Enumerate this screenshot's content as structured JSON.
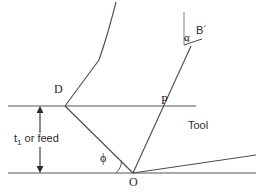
{
  "figure": {
    "stroke_color": "#4a4a4a",
    "line_color": "#8c8c8c",
    "text_color": "#2b2b2b",
    "background": "#ffffff",
    "width": 264,
    "height": 196
  },
  "labels": {
    "point_d": "D",
    "point_p": "P",
    "point_o": "O",
    "point_b_prime": "B´",
    "rake_angle": "α",
    "shear_angle": "ϕ",
    "tool": "Tool",
    "feed_t": "t",
    "feed_sub": "1",
    "feed_rest": " or feed"
  },
  "geometry": {
    "upper_surface_line": {
      "x1": 8,
      "y1": 106,
      "x2": 196,
      "y2": 106
    },
    "lower_surface_line": {
      "x1": 8,
      "y1": 173,
      "x2": 256,
      "y2": 173
    },
    "shear_plane": {
      "x1": 133,
      "y1": 173,
      "x2": 65,
      "y2": 106
    },
    "chip_lower": {
      "x1": 65,
      "y1": 106,
      "x2": 99,
      "y2": 60
    },
    "chip_upper_curve": "M 99 60 Q 108 34 116 2",
    "rake_face": {
      "x1": 133,
      "y1": 173,
      "x2": 191,
      "y2": 46
    },
    "vertical_reference": {
      "x1": 184,
      "y1": 12,
      "x2": 184,
      "y2": 45
    },
    "b_prime_line": {
      "x1": 184,
      "y1": 45,
      "x2": 203,
      "y2": 40
    },
    "flank_face": {
      "x1": 133,
      "y1": 173,
      "x2": 256,
      "y2": 155
    },
    "dimension_arrow": {
      "x": 40,
      "y_top": 107,
      "y_bottom": 172
    }
  },
  "annotations": {
    "alpha_arc_desc": "arc between vertical reference line and tool rake face at B´",
    "phi_arc_desc": "arc between machined surface and shear plane at O"
  }
}
